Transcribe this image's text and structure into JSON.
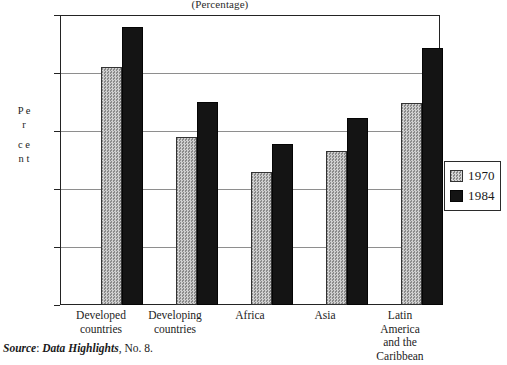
{
  "chart_data": {
    "type": "bar",
    "title": "(Percentage)",
    "xlabel": "",
    "ylabel": "Per cent",
    "ylim": [
      0,
      50
    ],
    "yticks": [
      0,
      10,
      20,
      30,
      40,
      50
    ],
    "grid": true,
    "legend_position": "right-outside",
    "categories": [
      "Developed countries",
      "Developing countries",
      "Africa",
      "Asia",
      "Latin America and the Caribbean"
    ],
    "category_lines": [
      [
        "Developed",
        "countries"
      ],
      [
        "Developing",
        "countries"
      ],
      [
        "Africa"
      ],
      [
        "Asia"
      ],
      [
        "Latin",
        "America",
        "and the",
        "Caribbean"
      ]
    ],
    "series": [
      {
        "name": "1970",
        "color": "#b4b4b4",
        "values": [
          41.0,
          29.0,
          23.0,
          26.6,
          34.8
        ]
      },
      {
        "name": "1984",
        "color": "#141414",
        "values": [
          48.0,
          35.0,
          27.7,
          32.2,
          44.3
        ]
      }
    ]
  },
  "axis": {
    "y_title_letters_top": [
      "P",
      "e",
      "r"
    ],
    "y_title_letters_bottom": [
      "c",
      "e",
      "n",
      "t"
    ],
    "tick_labels": [
      "50",
      "40",
      "30",
      "20",
      "10",
      "0"
    ]
  },
  "legend": {
    "entries": [
      {
        "label": "1970",
        "swatch": "hatched-gray-swatch"
      },
      {
        "label": "1984",
        "swatch": "solid-black-swatch"
      }
    ]
  },
  "source": {
    "prefix": "Source",
    "colon": ": ",
    "publication": "Data Highlights",
    "suffix": ", No. 8."
  }
}
